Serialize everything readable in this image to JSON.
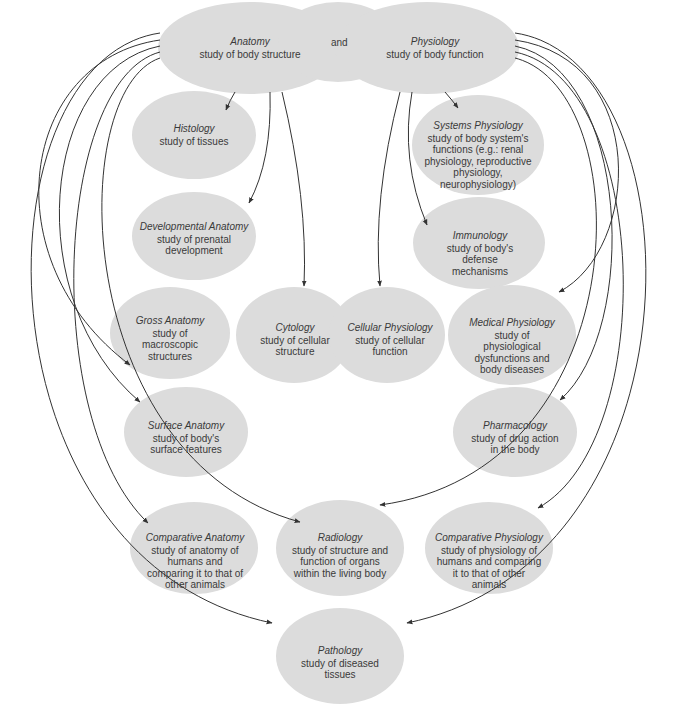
{
  "diagram": {
    "top_connector": "and",
    "colors": {
      "node_fill": "#dcdcdc",
      "line": "#333333",
      "background": "#ffffff"
    },
    "roots": {
      "anatomy": {
        "title": "Anatomy",
        "desc": "study of body structure"
      },
      "physiology": {
        "title": "Physiology",
        "desc": "study of body function"
      }
    },
    "nodes": {
      "histology": {
        "title": "Histology",
        "desc": "study of tissues"
      },
      "developmental_anatomy": {
        "title": "Developmental Anatomy",
        "desc": "study of prenatal development"
      },
      "gross_anatomy": {
        "title": "Gross Anatomy",
        "desc": "study of macroscopic structures"
      },
      "cytology": {
        "title": "Cytology",
        "desc": "study of cellular structure"
      },
      "cellular_physiology": {
        "title": "Cellular Physiology",
        "desc": "study of cellular function"
      },
      "surface_anatomy": {
        "title": "Surface Anatomy",
        "desc": "study of body's surface features"
      },
      "comparative_anatomy": {
        "title": "Comparative Anatomy",
        "desc": "study of anatomy of humans and comparing it to that of other animals"
      },
      "radiology": {
        "title": "Radiology",
        "desc": "study of structure and function of organs within the living body"
      },
      "systems_physiology": {
        "title": "Systems Physiology",
        "desc": "study of body system's functions (e.g.: renal physiology, reproductive physiology, neurophysiology)"
      },
      "immunology": {
        "title": "Immunology",
        "desc": "study of body's defense mechanisms"
      },
      "medical_physiology": {
        "title": "Medical Physiology",
        "desc": "study of physiological dysfunctions and body diseases"
      },
      "pharmacology": {
        "title": "Pharmacology",
        "desc": "study of drug action in the body"
      },
      "comparative_physiology": {
        "title": "Comparative Physiology",
        "desc": "study of physiology of humans and comparing it to that of other animals"
      },
      "pathology": {
        "title": "Pathology",
        "desc": "study of diseased tissues"
      }
    }
  }
}
